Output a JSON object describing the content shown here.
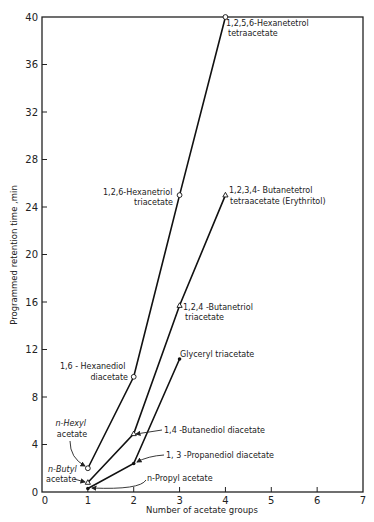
{
  "chart_data": {
    "type": "line",
    "title": "",
    "xlabel": "Number of acetate groups",
    "ylabel": "Programmed retention time ,min",
    "xlim": [
      0,
      7
    ],
    "ylim": [
      0,
      40
    ],
    "x_ticks": [
      "0",
      "1",
      "2",
      "3",
      "4",
      "5",
      "6",
      "7"
    ],
    "y_ticks": [
      "0",
      "4",
      "8",
      "12",
      "16",
      "20",
      "24",
      "28",
      "32",
      "36",
      "40"
    ],
    "grid": false,
    "legend": "none (direct annotations)",
    "series": [
      {
        "name": "Hexyl series",
        "marker": "open-circle",
        "points": [
          {
            "x": 1,
            "y": 2.0,
            "label": "n-Hexyl acetate"
          },
          {
            "x": 2,
            "y": 9.7,
            "label": "1,6-Hexanediol diacetate"
          },
          {
            "x": 3,
            "y": 25.0,
            "label": "1,2,6-Hexanetriol triacetate"
          },
          {
            "x": 4,
            "y": 40.0,
            "label": "1,2,5,6-Hexanetetrol tetraacetate"
          }
        ]
      },
      {
        "name": "Butyl series",
        "marker": "open-triangle",
        "points": [
          {
            "x": 1,
            "y": 0.8,
            "label": "n-Butyl acetate"
          },
          {
            "x": 2,
            "y": 4.9,
            "label": "1,4-Butanediol diacetate"
          },
          {
            "x": 3,
            "y": 15.7,
            "label": "1,2,4-Butanetriol triacetate"
          },
          {
            "x": 4,
            "y": 25.0,
            "label": "1,2,3,4- Butanetetrol tetraacetate (Erythritol)"
          }
        ]
      },
      {
        "name": "Propyl series",
        "marker": "filled-dot",
        "points": [
          {
            "x": 1,
            "y": 0.3,
            "label": "n-Propyl acetate"
          },
          {
            "x": 2,
            "y": 2.4,
            "label": "1,3-Propanediol diacetate"
          },
          {
            "x": 3,
            "y": 11.2,
            "label": "Glyceryl triacetate"
          }
        ]
      }
    ],
    "annotations": [
      {
        "lines": [
          "1,2,5,6-Hexanetetrol",
          "tetraacetate"
        ]
      },
      {
        "lines": [
          "1,2,6-Hexanetriol",
          "triacetate"
        ]
      },
      {
        "lines": [
          "1,2,3,4- Butanetetrol",
          "tetraacetate (Erythritol)"
        ]
      },
      {
        "lines": [
          "1,2,4 -Butanetriol",
          "triacetate"
        ]
      },
      {
        "lines": [
          "Glyceryl triacetate"
        ]
      },
      {
        "lines": [
          "1,6 - Hexanediol",
          "diacetate"
        ]
      },
      {
        "lines": [
          "n-Hexyl",
          "acetate"
        ]
      },
      {
        "lines": [
          "1,4 -Butanediol diacetate"
        ]
      },
      {
        "lines": [
          "1, 3 -Propanediol diacetate"
        ]
      },
      {
        "lines": [
          "n-Butyl",
          "acetate"
        ]
      },
      {
        "lines": [
          "n-Propyl acetate"
        ]
      }
    ]
  }
}
